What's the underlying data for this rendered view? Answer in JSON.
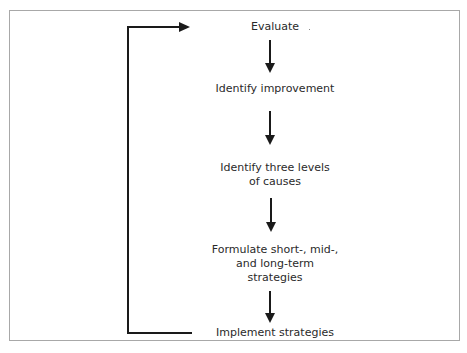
{
  "diagram": {
    "type": "flowchart-cycle",
    "steps": [
      {
        "id": "evaluate",
        "label": "Evaluate"
      },
      {
        "id": "identify-improvement",
        "label": "Identify improvement"
      },
      {
        "id": "identify-causes",
        "label": "Identify three levels of causes",
        "lines": [
          "Identify three levels",
          "of causes"
        ]
      },
      {
        "id": "formulate-strategies",
        "label": "Formulate short-, mid-, and long-term strategies",
        "lines": [
          "Formulate short-, mid-,",
          "and long-term",
          "strategies"
        ]
      },
      {
        "id": "implement-strategies",
        "label": "Implement strategies"
      }
    ],
    "edges": [
      {
        "from": "evaluate",
        "to": "identify-improvement"
      },
      {
        "from": "identify-improvement",
        "to": "identify-causes"
      },
      {
        "from": "identify-causes",
        "to": "formulate-strategies"
      },
      {
        "from": "formulate-strategies",
        "to": "implement-strategies"
      },
      {
        "from": "implement-strategies",
        "to": "evaluate",
        "style": "feedback-loop-left"
      }
    ],
    "colors": {
      "line": "#1a1a1a",
      "frame": "#a8a8a8",
      "background": "#ffffff"
    }
  }
}
